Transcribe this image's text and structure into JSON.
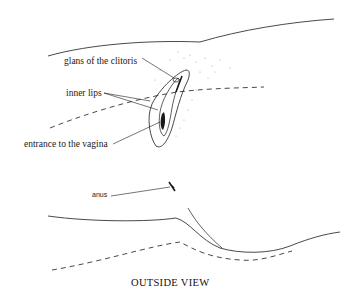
{
  "figure": {
    "caption": "OUTSIDE VIEW",
    "labels": {
      "glans": "glans of the clitoris",
      "inner_lips": "inner lips",
      "entrance": "entrance to the vagina",
      "anus": "anus"
    },
    "colors": {
      "ink": "#1a1a1a",
      "stipple": "#9a9a9a",
      "background": "#ffffff"
    }
  }
}
